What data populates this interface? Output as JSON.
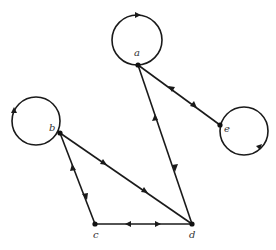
{
  "diagram": {
    "type": "directed multigraph",
    "nodes": [
      {
        "id": "a",
        "label": "a",
        "x": 138,
        "y": 65,
        "label_x": 134,
        "label_y": 56
      },
      {
        "id": "b",
        "label": "b",
        "x": 60,
        "y": 133,
        "label_x": 49,
        "label_y": 131
      },
      {
        "id": "c",
        "label": "c",
        "x": 95,
        "y": 224,
        "label_x": 93,
        "label_y": 238
      },
      {
        "id": "d",
        "label": "d",
        "x": 192,
        "y": 224,
        "label_x": 189,
        "label_y": 238
      },
      {
        "id": "e",
        "label": "e",
        "x": 220,
        "y": 125,
        "label_x": 224,
        "label_y": 132
      }
    ],
    "loops": [
      {
        "node": "a",
        "cx": 137,
        "cy": 40,
        "r": 25,
        "arrow_at": "top"
      },
      {
        "node": "b",
        "cx": 36,
        "cy": 121,
        "r": 24,
        "arrow_at": "left"
      },
      {
        "node": "e",
        "cx": 244,
        "cy": 131,
        "r": 24,
        "arrow_at": "bottom-right"
      }
    ],
    "edges": [
      {
        "from": "a",
        "to": "d",
        "direction": "both"
      },
      {
        "from": "a",
        "to": "e",
        "direction": "both"
      },
      {
        "from": "b",
        "to": "c",
        "direction": "both"
      },
      {
        "from": "b",
        "to": "d",
        "direction": "b-to-d"
      },
      {
        "from": "c",
        "to": "d",
        "direction": "both"
      }
    ],
    "caption": ""
  }
}
